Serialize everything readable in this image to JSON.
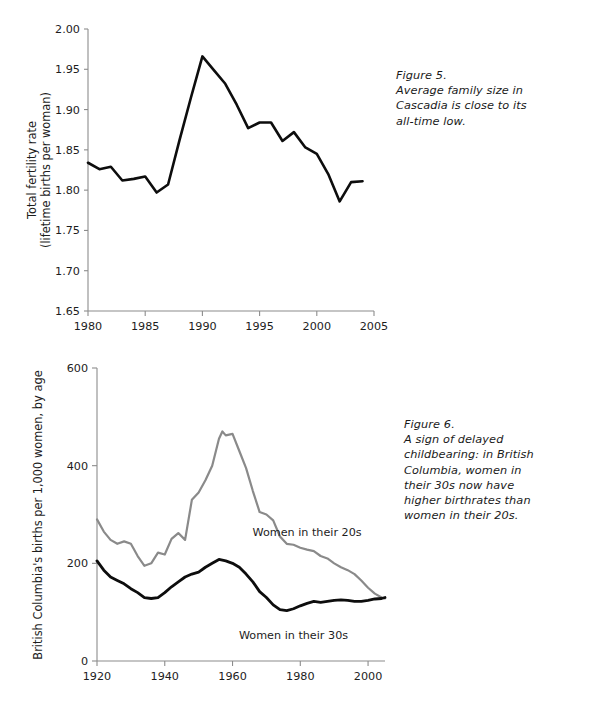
{
  "figure5": {
    "caption_lines": [
      "Figure 5.",
      "Average family size in",
      "Cascadia is close to its",
      "all-time low."
    ],
    "ylabel_line1": "Total fertility rate",
    "ylabel_line2": "(lifetime births per woman)",
    "ytick_labels": [
      "2.00",
      "1.95",
      "1.90",
      "1.85",
      "1.80",
      "1.75",
      "1.70",
      "1.65"
    ],
    "xtick_labels": [
      "1980",
      "1985",
      "1990",
      "1995",
      "2000",
      "2005"
    ],
    "line_color": "#0d0d0d",
    "axis_color": "#8c8c8c"
  },
  "figure6": {
    "caption_lines": [
      "Figure 6.",
      "A sign of delayed",
      "childbearing: in British",
      "Columbia, women in",
      "their 30s now have",
      "higher birthrates than",
      "women in their 20s."
    ],
    "ylabel": "British Columbia's births per 1,000 women, by age",
    "ytick_labels": [
      "600",
      "400",
      "200",
      "0"
    ],
    "xtick_labels": [
      "1920",
      "1940",
      "1960",
      "1980",
      "2000"
    ],
    "label_20s": "Women in their 20s",
    "label_30s": "Women in their 30s",
    "color_20s": "#8a8a8a",
    "color_30s": "#0d0d0d",
    "axis_color": "#8c8c8c"
  },
  "chart_data": [
    {
      "type": "line",
      "title": "Figure 5. Average family size in Cascadia is close to its all-time low.",
      "xlabel": "",
      "ylabel": "Total fertility rate (lifetime births per woman)",
      "xlim": [
        1980,
        2005
      ],
      "ylim": [
        1.65,
        2.0
      ],
      "xticks": [
        1980,
        1985,
        1990,
        1995,
        2000,
        2005
      ],
      "yticks": [
        1.65,
        1.7,
        1.75,
        1.8,
        1.85,
        1.9,
        1.95,
        2.0
      ],
      "grid": false,
      "legend": "none",
      "series": [
        {
          "name": "Total fertility rate",
          "color": "#0d0d0d",
          "x": [
            1980,
            1981,
            1982,
            1983,
            1984,
            1985,
            1986,
            1987,
            1988,
            1989,
            1990,
            1991,
            1992,
            1993,
            1994,
            1995,
            1996,
            1997,
            1998,
            1999,
            2000,
            2001,
            2002,
            2003,
            2004
          ],
          "values": [
            1.834,
            1.826,
            1.829,
            1.812,
            1.814,
            1.817,
            1.797,
            1.807,
            1.862,
            1.915,
            1.966,
            1.949,
            1.932,
            1.906,
            1.877,
            1.884,
            1.884,
            1.861,
            1.872,
            1.853,
            1.845,
            1.82,
            1.786,
            1.81,
            1.811
          ]
        }
      ]
    },
    {
      "type": "line",
      "title": "Figure 6. A sign of delayed childbearing: in British Columbia, women in their 30s now have higher birthrates than women in their 20s.",
      "xlabel": "",
      "ylabel": "British Columbia's births per 1,000 women, by age",
      "xlim": [
        1920,
        2005
      ],
      "ylim": [
        0,
        600
      ],
      "xticks": [
        1920,
        1940,
        1960,
        1980,
        2000
      ],
      "yticks": [
        0,
        200,
        400,
        600
      ],
      "grid": false,
      "legend": "inline-annotations",
      "annotations": [
        {
          "text": "Women in their 20s",
          "x": 1982,
          "y": 255
        },
        {
          "text": "Women in their 30s",
          "x": 1978,
          "y": 45
        }
      ],
      "series": [
        {
          "name": "Women in their 20s",
          "color": "#8a8a8a",
          "x": [
            1920,
            1922,
            1924,
            1926,
            1928,
            1930,
            1932,
            1934,
            1936,
            1938,
            1940,
            1942,
            1944,
            1946,
            1948,
            1950,
            1952,
            1954,
            1956,
            1957,
            1958,
            1960,
            1962,
            1964,
            1966,
            1968,
            1970,
            1972,
            1974,
            1976,
            1978,
            1980,
            1982,
            1984,
            1986,
            1988,
            1990,
            1992,
            1994,
            1996,
            1998,
            2000,
            2002,
            2004,
            2005
          ],
          "values": [
            290,
            265,
            248,
            240,
            245,
            240,
            215,
            195,
            200,
            222,
            218,
            250,
            262,
            248,
            330,
            345,
            370,
            400,
            455,
            470,
            462,
            465,
            430,
            395,
            348,
            305,
            300,
            288,
            255,
            240,
            238,
            232,
            228,
            225,
            215,
            210,
            200,
            192,
            186,
            178,
            165,
            150,
            138,
            130,
            128
          ]
        },
        {
          "name": "Women in their 30s",
          "color": "#0d0d0d",
          "x": [
            1920,
            1922,
            1924,
            1926,
            1928,
            1930,
            1932,
            1934,
            1936,
            1938,
            1940,
            1942,
            1944,
            1946,
            1948,
            1950,
            1952,
            1954,
            1956,
            1958,
            1960,
            1962,
            1964,
            1966,
            1968,
            1970,
            1972,
            1974,
            1976,
            1978,
            1980,
            1982,
            1984,
            1986,
            1988,
            1990,
            1992,
            1994,
            1996,
            1998,
            2000,
            2002,
            2004,
            2005
          ],
          "values": [
            205,
            186,
            172,
            165,
            158,
            148,
            140,
            130,
            128,
            130,
            140,
            152,
            162,
            172,
            178,
            182,
            192,
            200,
            208,
            205,
            200,
            192,
            178,
            162,
            142,
            130,
            115,
            105,
            103,
            107,
            113,
            118,
            122,
            120,
            122,
            124,
            125,
            124,
            122,
            122,
            124,
            127,
            128,
            130
          ]
        }
      ]
    }
  ]
}
